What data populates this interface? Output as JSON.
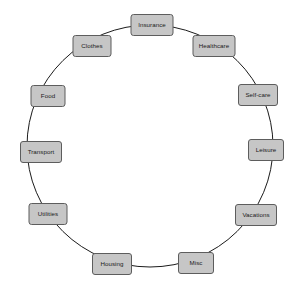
{
  "diagram": {
    "type": "cycle",
    "title": "",
    "background_color": "#ffffff",
    "node_fill_color": "#c6c6c6",
    "node_border_color": "#5d5d5d",
    "node_text_color": "#1b1b1b",
    "link_color": "#1b1b1b",
    "ring": {
      "center_x": 150,
      "center_y": 146,
      "radius_x": 123,
      "radius_y": 121,
      "stroke_width": 1
    },
    "nodes": [
      {
        "id": "insurance",
        "label": "Insurance",
        "angle_deg": -90,
        "x": 152,
        "y": 25,
        "w": 43,
        "h": 22
      },
      {
        "id": "healthcare",
        "label": "Healthcare",
        "angle_deg": -60,
        "x": 214,
        "y": 46,
        "w": 43,
        "h": 22
      },
      {
        "id": "self-care",
        "label": "Self-care",
        "angle_deg": -30,
        "x": 258,
        "y": 95,
        "w": 40,
        "h": 22
      },
      {
        "id": "leisure",
        "label": "Leisure",
        "angle_deg": 0,
        "x": 266,
        "y": 150,
        "w": 36,
        "h": 22
      },
      {
        "id": "vacations",
        "label": "Vacations",
        "angle_deg": 30,
        "x": 256,
        "y": 215,
        "w": 42,
        "h": 22
      },
      {
        "id": "misc",
        "label": "Misc",
        "angle_deg": 60,
        "x": 196,
        "y": 263,
        "w": 36,
        "h": 22
      },
      {
        "id": "housing",
        "label": "Housing",
        "angle_deg": 90,
        "x": 112,
        "y": 264,
        "w": 40,
        "h": 22
      },
      {
        "id": "utilities",
        "label": "Utilities",
        "angle_deg": 120,
        "x": 48,
        "y": 214,
        "w": 39,
        "h": 22
      },
      {
        "id": "transport",
        "label": "Transport",
        "angle_deg": 150,
        "x": 41,
        "y": 152,
        "w": 42,
        "h": 22
      },
      {
        "id": "food",
        "label": "Food",
        "angle_deg": 180,
        "x": 48,
        "y": 96,
        "w": 35,
        "h": 22
      },
      {
        "id": "clothes",
        "label": "Clothes",
        "angle_deg": 210,
        "x": 92,
        "y": 46,
        "w": 39,
        "h": 22
      }
    ]
  }
}
